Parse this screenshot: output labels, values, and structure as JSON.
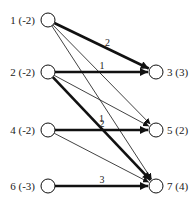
{
  "diagram": {
    "type": "bipartite-transportation-network",
    "source_nodes": [
      {
        "id": "1",
        "label": "1 (-2)",
        "x": 48,
        "y": 20
      },
      {
        "id": "2",
        "label": "2 (-2)",
        "x": 48,
        "y": 72
      },
      {
        "id": "4",
        "label": "4 (-2)",
        "x": 48,
        "y": 130
      },
      {
        "id": "6",
        "label": "6 (-3)",
        "x": 48,
        "y": 186
      }
    ],
    "sink_nodes": [
      {
        "id": "3",
        "label": "3 (3)",
        "x": 156,
        "y": 72
      },
      {
        "id": "5",
        "label": "5 (2)",
        "x": 156,
        "y": 130
      },
      {
        "id": "7",
        "label": "7 (4)",
        "x": 156,
        "y": 186
      }
    ],
    "edges": [
      {
        "from": "1",
        "to": "3",
        "flow": "2",
        "bold": true
      },
      {
        "from": "1",
        "to": "5",
        "flow": "",
        "bold": false
      },
      {
        "from": "1",
        "to": "7",
        "flow": "",
        "bold": false
      },
      {
        "from": "2",
        "to": "3",
        "flow": "1",
        "bold": true
      },
      {
        "from": "2",
        "to": "5",
        "flow": "",
        "bold": false
      },
      {
        "from": "2",
        "to": "7",
        "flow": "1",
        "bold": true
      },
      {
        "from": "4",
        "to": "5",
        "flow": "2",
        "bold": true
      },
      {
        "from": "4",
        "to": "7",
        "flow": "",
        "bold": false
      },
      {
        "from": "6",
        "to": "7",
        "flow": "3",
        "bold": true
      }
    ],
    "colors": {
      "line": "#111111",
      "node_fill": "#ffffff",
      "text": "#222222"
    }
  }
}
